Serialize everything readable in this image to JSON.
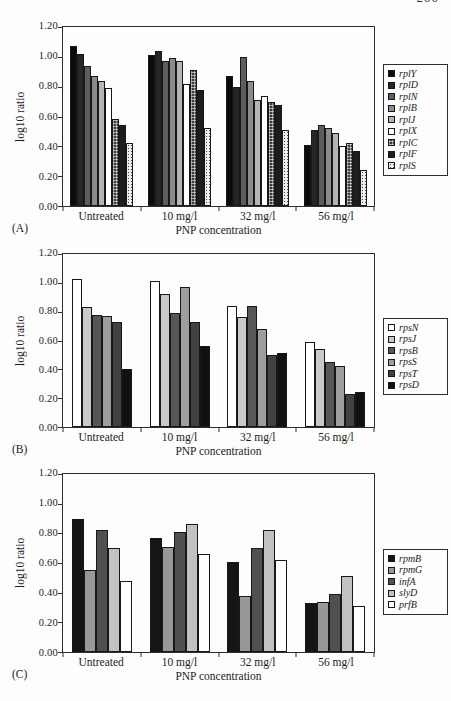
{
  "page": {
    "page_number_fragment": "200"
  },
  "chart_data": [
    {
      "type": "bar",
      "panel_label": "(A)",
      "xlabel": "PNP concentration",
      "ylabel": "log10 ratio",
      "ylim": [
        0,
        1.2
      ],
      "yticks": [
        "1.20",
        "1.00",
        "0.80",
        "0.60",
        "0.40",
        "0.20",
        "0.00"
      ],
      "grid": false,
      "legend_position": "right",
      "bar_width": 7,
      "categories": [
        "Untreated",
        "10 mg/l",
        "32 mg/l",
        "56 mg/l"
      ],
      "series": [
        {
          "name": "rplY",
          "color": "#0b0b0b",
          "pattern": "solid",
          "values": [
            1.07,
            1.01,
            0.87,
            0.41
          ]
        },
        {
          "name": "rplD",
          "color": "#262626",
          "pattern": "solid",
          "values": [
            1.02,
            1.04,
            0.8,
            0.51
          ]
        },
        {
          "name": "rplN",
          "color": "#5d5d5d",
          "pattern": "solid",
          "values": [
            0.94,
            0.97,
            1.0,
            0.54
          ]
        },
        {
          "name": "rplB",
          "color": "#8c8c8c",
          "pattern": "solid",
          "values": [
            0.87,
            0.99,
            0.84,
            0.52
          ]
        },
        {
          "name": "rplJ",
          "color": "#b5b5b5",
          "pattern": "solid",
          "values": [
            0.84,
            0.97,
            0.71,
            0.49
          ]
        },
        {
          "name": "rplX",
          "color": "#ffffff",
          "pattern": "solid",
          "values": [
            0.79,
            0.82,
            0.74,
            0.4
          ]
        },
        {
          "name": "rplC",
          "color": "#3d3d3d",
          "pattern": "dark-stipple",
          "values": [
            0.58,
            0.91,
            0.7,
            0.42
          ]
        },
        {
          "name": "rplF",
          "color": "#1d1d1d",
          "pattern": "solid",
          "values": [
            0.54,
            0.78,
            0.68,
            0.37
          ]
        },
        {
          "name": "rplS",
          "color": "#ededed",
          "pattern": "light-stipple",
          "values": [
            0.42,
            0.52,
            0.51,
            0.24
          ]
        }
      ]
    },
    {
      "type": "bar",
      "panel_label": "(B)",
      "xlabel": "PNP concentration",
      "ylabel": "log10 ratio",
      "ylim": [
        0,
        1.2
      ],
      "yticks": [
        "1.20",
        "1.00",
        "0.80",
        "0.60",
        "0.40",
        "0.20",
        "0.00"
      ],
      "grid": false,
      "legend_position": "right",
      "bar_width": 10,
      "categories": [
        "Untreated",
        "10 mg/l",
        "32 mg/l",
        "56 mg/l"
      ],
      "series": [
        {
          "name": "rpsN",
          "color": "#ffffff",
          "pattern": "solid",
          "values": [
            1.03,
            1.01,
            0.84,
            0.59
          ]
        },
        {
          "name": "rpsJ",
          "color": "#c9c9c9",
          "pattern": "solid",
          "values": [
            0.83,
            0.92,
            0.76,
            0.54
          ]
        },
        {
          "name": "rpsB",
          "color": "#575757",
          "pattern": "solid",
          "values": [
            0.78,
            0.79,
            0.84,
            0.45
          ]
        },
        {
          "name": "rpsS",
          "color": "#9e9e9e",
          "pattern": "solid",
          "values": [
            0.77,
            0.97,
            0.68,
            0.42
          ]
        },
        {
          "name": "rpsT",
          "color": "#414141",
          "pattern": "solid",
          "values": [
            0.73,
            0.73,
            0.5,
            0.23
          ]
        },
        {
          "name": "rpsD",
          "color": "#111111",
          "pattern": "solid",
          "values": [
            0.4,
            0.56,
            0.51,
            0.24
          ]
        }
      ]
    },
    {
      "type": "bar",
      "panel_label": "(C)",
      "xlabel": "PNP concentration",
      "ylabel": "log10 ratio",
      "ylim": [
        0,
        1.2
      ],
      "yticks": [
        "1.20",
        "1.00",
        "0.80",
        "0.60",
        "0.40",
        "0.20",
        "0.00"
      ],
      "grid": false,
      "legend_position": "right",
      "bar_width": 12,
      "categories": [
        "Untreated",
        "10 mg/l",
        "32 mg/l",
        "56 mg/l"
      ],
      "series": [
        {
          "name": "rpmB",
          "color": "#151515",
          "pattern": "solid",
          "values": [
            0.9,
            0.77,
            0.61,
            0.33
          ]
        },
        {
          "name": "rpmG",
          "color": "#989898",
          "pattern": "solid",
          "values": [
            0.55,
            0.71,
            0.38,
            0.34
          ]
        },
        {
          "name": "infA",
          "color": "#505050",
          "pattern": "solid",
          "values": [
            0.82,
            0.81,
            0.7,
            0.39
          ]
        },
        {
          "name": "slyD",
          "color": "#c1c1c1",
          "pattern": "solid",
          "values": [
            0.7,
            0.86,
            0.82,
            0.51
          ]
        },
        {
          "name": "prfB",
          "color": "#ffffff",
          "pattern": "solid",
          "values": [
            0.48,
            0.66,
            0.62,
            0.31
          ]
        }
      ]
    }
  ]
}
